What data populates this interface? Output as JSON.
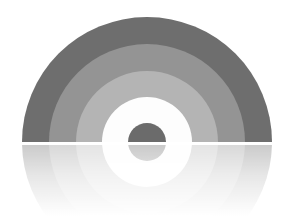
{
  "canvas": {
    "width": 295,
    "height": 216,
    "background_color": "#ffffff",
    "title": "Concentric Arc Logo"
  },
  "graphic": {
    "name": "concentric-half-ring-logo",
    "description": "Grayscale concentric semicircular arc (rainbow-style) above a horizon line, with a soft faded mirror reflection below",
    "center_x": 147,
    "horizon_y": 142,
    "horizon_gap_color": "#ffffff",
    "horizon_gap_height": 3,
    "rings": [
      {
        "name": "ring-outer",
        "label": "Outer ring",
        "outer_radius": 125,
        "inner_radius": 98,
        "color": "#6e6e6e"
      },
      {
        "name": "ring-second",
        "label": "Second ring",
        "outer_radius": 98,
        "inner_radius": 71,
        "color": "#949494"
      },
      {
        "name": "ring-third",
        "label": "Third ring",
        "outer_radius": 71,
        "inner_radius": 45,
        "color": "#b4b4b4"
      },
      {
        "name": "ring-fourth",
        "label": "Fourth ring (white)",
        "outer_radius": 45,
        "inner_radius": 19,
        "color": "#fdfdfd"
      },
      {
        "name": "core-disc",
        "label": "Center disc",
        "outer_radius": 19,
        "inner_radius": 0,
        "color": "#6b6b6b"
      }
    ],
    "reflection": {
      "name": "reflection",
      "label": "Mirrored reflection",
      "enabled": true,
      "start_opacity": 0.38,
      "end_opacity": 0.0,
      "fade_end_y": 210
    }
  }
}
